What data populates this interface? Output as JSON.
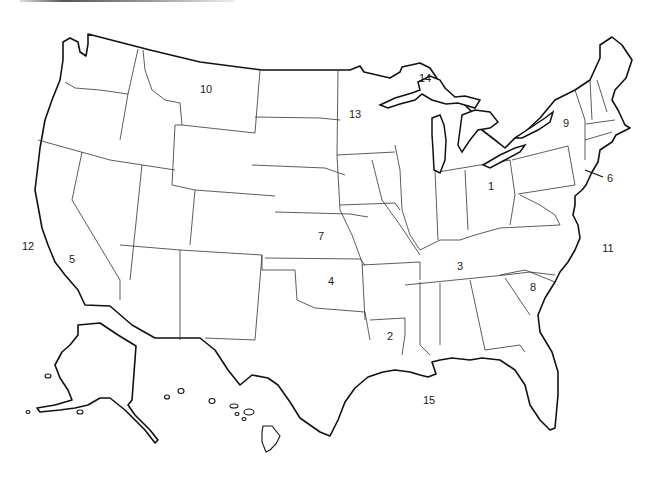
{
  "map": {
    "title": "United States outline map",
    "labels": [
      {
        "id": "1",
        "text": "1",
        "x": 491,
        "y": 186
      },
      {
        "id": "2",
        "text": "2",
        "x": 390,
        "y": 336
      },
      {
        "id": "3",
        "text": "3",
        "x": 460,
        "y": 266
      },
      {
        "id": "4",
        "text": "4",
        "x": 331,
        "y": 281
      },
      {
        "id": "5",
        "text": "5",
        "x": 72,
        "y": 259
      },
      {
        "id": "6",
        "text": "6",
        "x": 610,
        "y": 178
      },
      {
        "id": "7",
        "text": "7",
        "x": 321,
        "y": 236
      },
      {
        "id": "8",
        "text": "8",
        "x": 533,
        "y": 287
      },
      {
        "id": "9",
        "text": "9",
        "x": 566,
        "y": 123
      },
      {
        "id": "10",
        "text": "10",
        "x": 206,
        "y": 89
      },
      {
        "id": "11",
        "text": "11",
        "x": 608,
        "y": 248
      },
      {
        "id": "12",
        "text": "12",
        "x": 28,
        "y": 246
      },
      {
        "id": "13",
        "text": "13",
        "x": 355,
        "y": 114
      },
      {
        "id": "14",
        "text": "14",
        "x": 425,
        "y": 78
      },
      {
        "id": "15",
        "text": "15",
        "x": 429,
        "y": 400
      }
    ],
    "colors": {
      "stroke": "#111111",
      "background": "#ffffff",
      "label": "#1a1a1a"
    }
  }
}
